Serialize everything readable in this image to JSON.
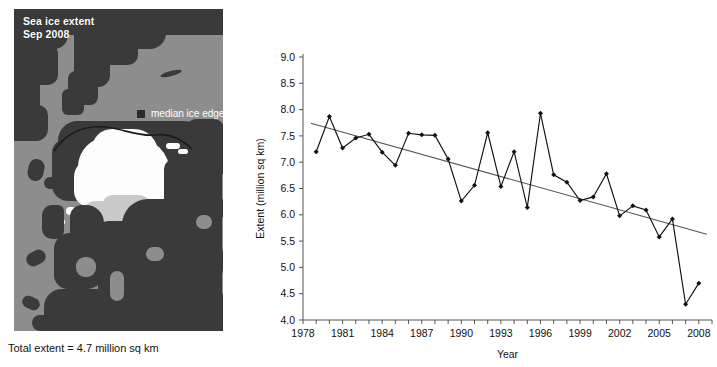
{
  "map": {
    "title_line1": "Sea ice extent",
    "title_line2": "Sep 2008",
    "legend_label": "median ice edge",
    "legend_swatch_color": "#2b2b2b",
    "caption": "Total extent = 4.7 million sq km",
    "ocean_color": "#8d8d8d",
    "land_color": "#3a3a3a",
    "ice_color": "#fdfdfd"
  },
  "chart_data": {
    "type": "line",
    "title": "",
    "xlabel": "Year",
    "ylabel": "Extent (million sq km)",
    "xlim": [
      1978,
      2009
    ],
    "ylim": [
      4.0,
      9.0
    ],
    "ytick_step": 0.5,
    "yticks": [
      "9.0",
      "8.5",
      "8.0",
      "7.5",
      "7.0",
      "6.5",
      "6.0",
      "5.5",
      "5.0",
      "4.5",
      "4.0"
    ],
    "xticks_labeled": [
      "1978",
      "1981",
      "1984",
      "1987",
      "1990",
      "1993",
      "1996",
      "1999",
      "2002",
      "2005",
      "2008"
    ],
    "xtick_every": 1,
    "grid": false,
    "legend": "none",
    "marker": "diamond",
    "series": [
      {
        "name": "September sea ice extent",
        "x": [
          1979,
          1980,
          1981,
          1982,
          1983,
          1984,
          1985,
          1986,
          1987,
          1988,
          1989,
          1990,
          1991,
          1992,
          1993,
          1994,
          1995,
          1996,
          1997,
          1998,
          1999,
          2000,
          2001,
          2002,
          2003,
          2004,
          2005,
          2006,
          2007,
          2008
        ],
        "values": [
          7.2,
          7.87,
          7.27,
          7.46,
          7.53,
          7.19,
          6.94,
          7.55,
          7.52,
          7.51,
          7.06,
          6.26,
          6.56,
          7.56,
          6.54,
          7.2,
          6.14,
          7.93,
          6.76,
          6.62,
          6.27,
          6.34,
          6.78,
          5.98,
          6.17,
          6.09,
          5.58,
          5.92,
          4.3,
          4.7
        ]
      }
    ],
    "trend": {
      "name": "linear trend",
      "x_start": 1978.6,
      "x_end": 2008.6,
      "y_start": 7.74,
      "y_end": 5.63,
      "color": "#555555"
    }
  }
}
